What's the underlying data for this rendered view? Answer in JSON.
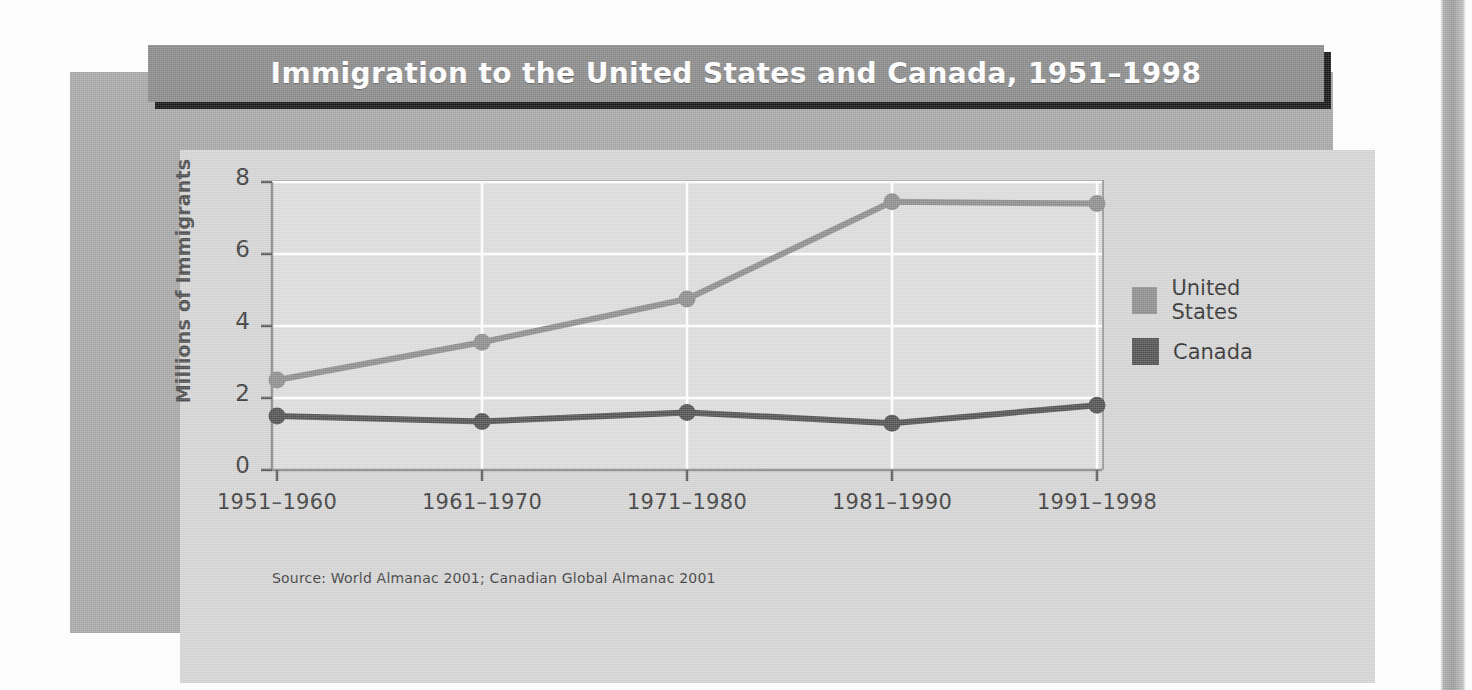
{
  "figure": {
    "title": "Immigration to the United States and Canada, 1951–1998",
    "source_note": "Source: World Almanac 2001; Canadian Global Almanac 2001"
  },
  "legend": {
    "position": "right",
    "entries": [
      {
        "label": "United States",
        "color": "#8c8c8c",
        "icon": "legend-swatch-icon"
      },
      {
        "label": "Canada",
        "color": "#4f4f4f",
        "icon": "legend-swatch-icon"
      }
    ]
  },
  "chart_data": {
    "type": "line",
    "title": "Immigration to the United States and Canada, 1951–1998",
    "xlabel": "",
    "ylabel": "Millions of Immigrants",
    "categories": [
      "1951–1960",
      "1961–1970",
      "1971–1980",
      "1981–1990",
      "1991–1998"
    ],
    "series": [
      {
        "name": "United States",
        "color": "#8c8c8c",
        "values": [
          2.5,
          3.55,
          4.75,
          7.45,
          7.4
        ]
      },
      {
        "name": "Canada",
        "color": "#4f4f4f",
        "values": [
          1.5,
          1.35,
          1.6,
          1.3,
          1.8
        ]
      }
    ],
    "ylim": [
      0,
      8
    ],
    "yticks": [
      0,
      2,
      4,
      6,
      8
    ],
    "ytick_labels": [
      "0",
      "2",
      "4",
      "6",
      "8"
    ],
    "grid": true,
    "grid_color": "#ffffff",
    "plot_background": "#dcdcdc",
    "marker": "circle",
    "legend_position": "right"
  },
  "colors": {
    "frame": "#a6a6a6",
    "panel": "#d4d4d4",
    "title_bar": "#888888",
    "title_text": "#ffffff",
    "title_shadow": "#111111",
    "axis": "#8a8a8a",
    "text": "#3a3a3a"
  }
}
